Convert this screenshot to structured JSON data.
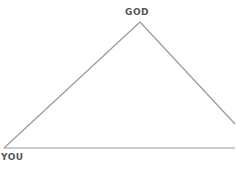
{
  "diagram": {
    "labels": {
      "top": "GOD",
      "bottom_left": "YOU"
    },
    "line_color": "#9a9a9a",
    "label_color": "#555555"
  }
}
